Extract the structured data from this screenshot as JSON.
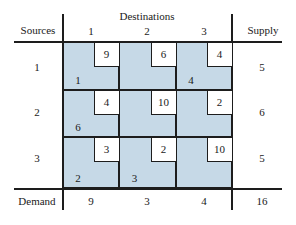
{
  "header": {
    "sources_label": "Sources",
    "destinations_label": "Destinations",
    "supply_label": "Supply",
    "demand_label": "Demand"
  },
  "colors": {
    "cell_fill": "#c6d9e7",
    "cost_box_fill": "#ffffff",
    "rule": "#1d1d1d",
    "text": "#1a1a1a",
    "background": "#ffffff"
  },
  "destination_columns": [
    "1",
    "2",
    "3"
  ],
  "source_rows": [
    "1",
    "2",
    "3"
  ],
  "supply": [
    "5",
    "6",
    "5"
  ],
  "demand": [
    "9",
    "3",
    "4"
  ],
  "total": "16",
  "cells": [
    [
      {
        "cost": "9",
        "allocation": "1"
      },
      {
        "cost": "6",
        "allocation": ""
      },
      {
        "cost": "4",
        "allocation": "4"
      }
    ],
    [
      {
        "cost": "4",
        "allocation": "6"
      },
      {
        "cost": "10",
        "allocation": ""
      },
      {
        "cost": "2",
        "allocation": ""
      }
    ],
    [
      {
        "cost": "3",
        "allocation": "2"
      },
      {
        "cost": "2",
        "allocation": "3"
      },
      {
        "cost": "10",
        "allocation": ""
      }
    ]
  ],
  "chart_data": {
    "type": "table",
    "xlabel": "Destinations",
    "ylabel": "Sources",
    "categories": [
      "1",
      "2",
      "3"
    ],
    "row_categories": [
      "1",
      "2",
      "3"
    ],
    "cost_matrix": [
      [
        9,
        6,
        4
      ],
      [
        4,
        10,
        2
      ],
      [
        3,
        2,
        10
      ]
    ],
    "allocation_matrix": [
      [
        1,
        null,
        4
      ],
      [
        6,
        null,
        null
      ],
      [
        2,
        3,
        null
      ]
    ],
    "supply": [
      5,
      6,
      5
    ],
    "demand": [
      9,
      3,
      4
    ],
    "total_supply": 16,
    "total_demand": 16,
    "grid": true,
    "legend": "none"
  }
}
